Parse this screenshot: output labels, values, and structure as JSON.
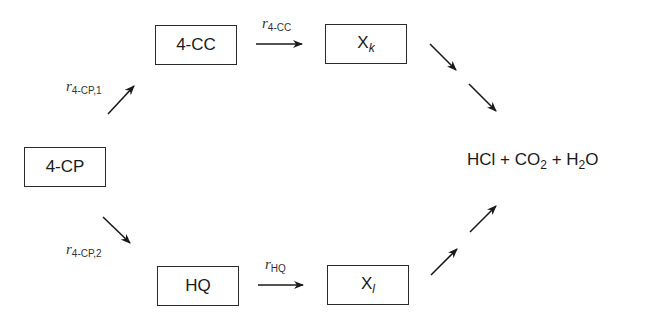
{
  "diagram": {
    "type": "reaction-pathway",
    "nodes": {
      "reactant": {
        "label": "4-CP"
      },
      "intermediate_upper": {
        "label": "4-CC"
      },
      "intermediate_lower": {
        "label": "HQ"
      },
      "xk": {
        "base": "X",
        "sub": "k"
      },
      "xl": {
        "base": "X",
        "sub": "l"
      }
    },
    "products": {
      "hcl": "HCl",
      "plus1": " + ",
      "co2_base": "CO",
      "co2_sub": "2",
      "plus2": " + ",
      "h2o_h": "H",
      "h2o_sub": "2",
      "h2o_o": "O"
    },
    "rates": {
      "r_4cp_1": {
        "symbol": "r",
        "sub": "4-CP,1"
      },
      "r_4cp_2": {
        "symbol": "r",
        "sub": "4-CP,2"
      },
      "r_4cc": {
        "symbol": "r",
        "sub": "4-CC"
      },
      "r_hq": {
        "symbol": "r",
        "sub": "HQ"
      }
    },
    "colors": {
      "line": "#1a1a1a",
      "background": "#ffffff"
    }
  }
}
